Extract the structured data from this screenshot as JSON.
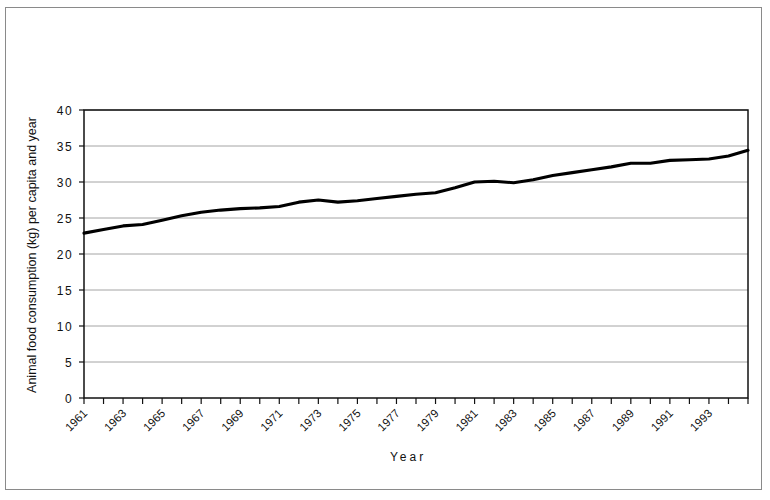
{
  "figure": {
    "background_color": "#ffffff",
    "frame_color": "#8a8a8a",
    "axis_color": "#111111",
    "grid_color": "#9a9a9a",
    "line_color": "#000000"
  },
  "chart_data": {
    "type": "line",
    "title": "",
    "xlabel": "Year",
    "ylabel": "Animal food consumption (kg) per capita and year",
    "xlim": [
      1961,
      1995
    ],
    "ylim": [
      0,
      40
    ],
    "grid": true,
    "legend": "none",
    "xtick_labels": [
      "1961",
      "1963",
      "1965",
      "1967",
      "1969",
      "1971",
      "1973",
      "1975",
      "1977",
      "1979",
      "1981",
      "1983",
      "1985",
      "1987",
      "1989",
      "1991",
      "1993"
    ],
    "xtick_values": [
      1961,
      1963,
      1965,
      1967,
      1969,
      1971,
      1973,
      1975,
      1977,
      1979,
      1981,
      1983,
      1985,
      1987,
      1989,
      1991,
      1993
    ],
    "xtick_minor_values": [
      1962,
      1964,
      1966,
      1968,
      1970,
      1972,
      1974,
      1976,
      1978,
      1980,
      1982,
      1984,
      1986,
      1988,
      1990,
      1992,
      1994,
      1995
    ],
    "ytick_labels": [
      "0",
      "5",
      "10",
      "15",
      "20",
      "25",
      "30",
      "35",
      "40"
    ],
    "ytick_values": [
      0,
      5,
      10,
      15,
      20,
      25,
      30,
      35,
      40
    ],
    "series": [
      {
        "name": "Animal food consumption",
        "x": [
          1961,
          1962,
          1963,
          1964,
          1965,
          1966,
          1967,
          1968,
          1969,
          1970,
          1971,
          1972,
          1973,
          1974,
          1975,
          1976,
          1977,
          1978,
          1979,
          1980,
          1981,
          1982,
          1983,
          1984,
          1985,
          1986,
          1987,
          1988,
          1989,
          1990,
          1991,
          1992,
          1993,
          1994,
          1995
        ],
        "values": [
          22.9,
          23.4,
          23.9,
          24.1,
          24.7,
          25.3,
          25.8,
          26.1,
          26.3,
          26.4,
          26.6,
          27.2,
          27.5,
          27.2,
          27.4,
          27.7,
          28.0,
          28.3,
          28.5,
          29.2,
          30.0,
          30.1,
          29.9,
          30.3,
          30.9,
          31.3,
          31.7,
          32.1,
          32.6,
          32.6,
          33.0,
          33.1,
          33.2,
          33.6,
          34.4
        ]
      }
    ]
  }
}
